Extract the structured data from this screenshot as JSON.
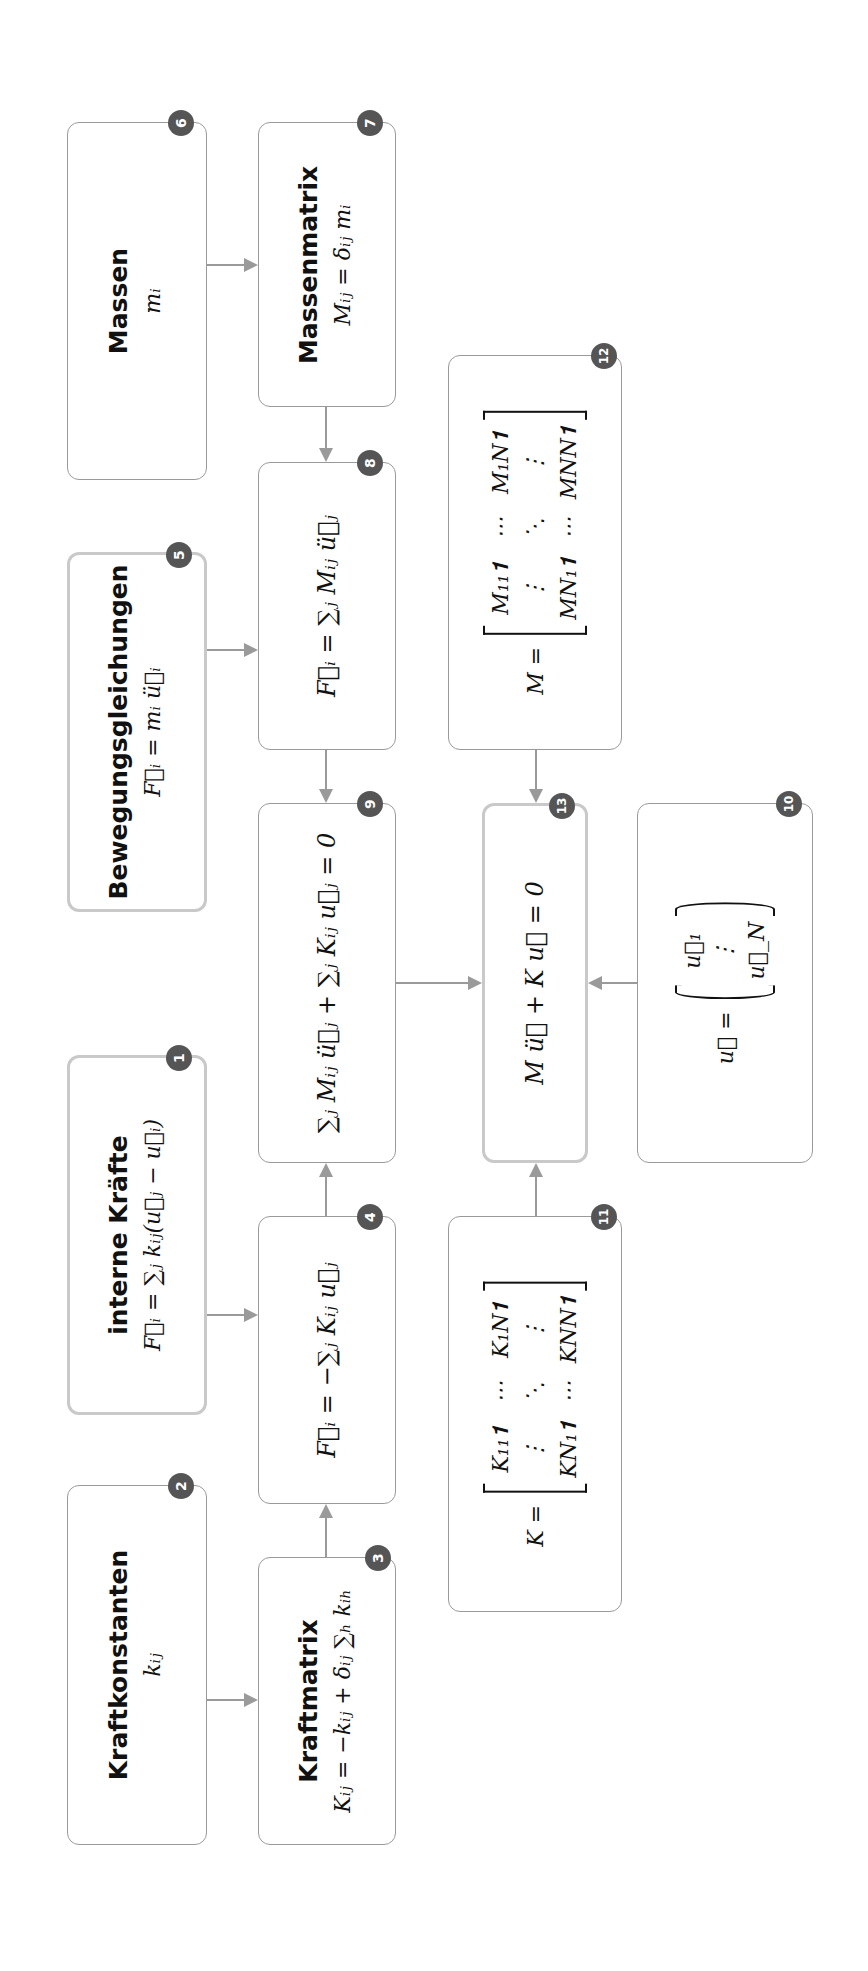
{
  "diagram": {
    "orientation": "rotated -90deg (text reads bottom-to-top)",
    "nodes": [
      {
        "id": 1,
        "badge": "1",
        "title": "interne Kräfte",
        "formula": "F⃗ᵢ = ∑ⱼ kᵢⱼ(u⃗ⱼ − u⃗ᵢ)",
        "highlight": true
      },
      {
        "id": 2,
        "badge": "2",
        "title": "Kraftkonstanten",
        "formula": "kᵢⱼ",
        "highlight": false
      },
      {
        "id": 3,
        "badge": "3",
        "title": "Kraftmatrix",
        "formula": "Kᵢⱼ = −kᵢⱼ + δᵢⱼ ∑ₕ kᵢₕ",
        "highlight": false
      },
      {
        "id": 4,
        "badge": "4",
        "title": "",
        "formula": "F⃗ᵢ = −∑ⱼ Kᵢⱼ u⃗ⱼ",
        "highlight": false
      },
      {
        "id": 5,
        "badge": "5",
        "title": "Bewegungsgleichungen",
        "formula": "F⃗ᵢ = mᵢ ü⃗ᵢ",
        "highlight": true
      },
      {
        "id": 6,
        "badge": "6",
        "title": "Massen",
        "formula": "mᵢ",
        "highlight": false
      },
      {
        "id": 7,
        "badge": "7",
        "title": "Massenmatrix",
        "formula": "Mᵢⱼ = δᵢⱼ mᵢ",
        "highlight": false
      },
      {
        "id": 8,
        "badge": "8",
        "title": "",
        "formula": "F⃗ᵢ = ∑ⱼ Mᵢⱼ ü⃗ⱼ",
        "highlight": false
      },
      {
        "id": 9,
        "badge": "9",
        "title": "",
        "formula": "∑ⱼ Mᵢⱼ ü⃗ⱼ + ∑ⱼ Kᵢⱼ u⃗ⱼ = 0",
        "highlight": false
      },
      {
        "id": 10,
        "badge": "10",
        "title": "",
        "lhs": "u⃗ =",
        "vector": [
          "u⃗₁",
          "⋮",
          "u⃗_N"
        ],
        "highlight": false
      },
      {
        "id": 11,
        "badge": "11",
        "lhs": "K =",
        "matrix": [
          [
            "K₁₁𝟏",
            "⋯",
            "K₁N𝟏"
          ],
          [
            "⋮",
            "⋱",
            "⋮"
          ],
          [
            "KN₁𝟏",
            "⋯",
            "KNN𝟏"
          ]
        ],
        "highlight": false
      },
      {
        "id": 12,
        "badge": "12",
        "lhs": "M =",
        "matrix": [
          [
            "M₁₁𝟏",
            "⋯",
            "M₁N𝟏"
          ],
          [
            "⋮",
            "⋱",
            "⋮"
          ],
          [
            "MN₁𝟏",
            "⋯",
            "MNN𝟏"
          ]
        ],
        "highlight": false
      },
      {
        "id": 13,
        "badge": "13",
        "title": "",
        "formula": "M ü⃗ + K u⃗ = 0",
        "highlight": true
      }
    ],
    "edges": [
      {
        "from": 6,
        "to": 7
      },
      {
        "from": 7,
        "to": 8
      },
      {
        "from": 5,
        "to": 8
      },
      {
        "from": 8,
        "to": 9
      },
      {
        "from": 4,
        "to": 9
      },
      {
        "from": 1,
        "to": 4
      },
      {
        "from": 2,
        "to": 3
      },
      {
        "from": 3,
        "to": 4
      },
      {
        "from": 9,
        "to": 13
      },
      {
        "from": 12,
        "to": 13
      },
      {
        "from": 11,
        "to": 13
      },
      {
        "from": 10,
        "to": 13
      }
    ],
    "colors": {
      "border": "#9a9a9a",
      "highlight_border": "#c9c9c9",
      "badge": "#555555",
      "arrow": "#9a9a9a"
    }
  }
}
